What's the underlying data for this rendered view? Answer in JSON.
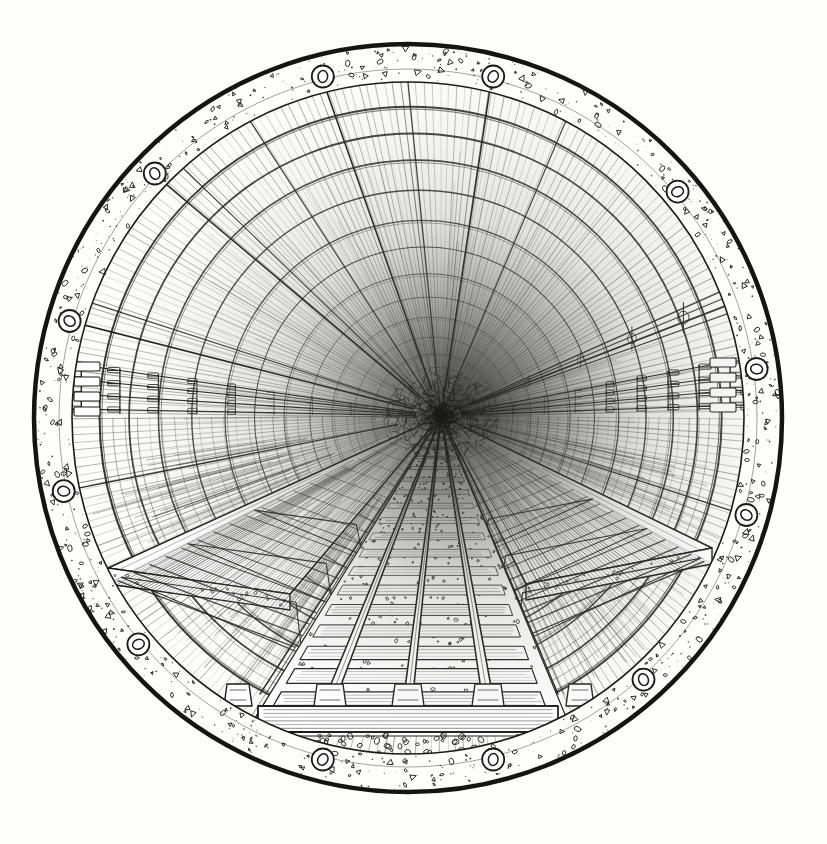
{
  "artwork": {
    "title": "Railway Tunnel Interior",
    "medium": "pen-and-ink line drawing",
    "subject": "single-track railway tunnel seen head-on in a circular vignette",
    "canvas": {
      "width": 827,
      "height": 844,
      "background": "#fdfdfc"
    },
    "ink_color": "#1a1a18",
    "paper_color": "#fdfdfc"
  },
  "circle_frame": {
    "name": "circular-vignette",
    "center_x": 408,
    "center_y": 418,
    "outer_radius": 374,
    "inner_radius": 336,
    "outer_stroke_width": 4.5,
    "inner_stroke_width": 1.6,
    "ring_label": "concrete aggregate ring",
    "aggregate_count": 320,
    "speckle_count": 520
  },
  "anchors": {
    "name": "segment-bolt-anchors",
    "label": "bolt rings set in the tunnel lining",
    "radius_from_center": 352,
    "ring_outer_r": 11,
    "ring_inner_r": 6,
    "angles_deg": [
      -104,
      -76,
      -40,
      -8,
      16,
      48,
      76,
      104,
      140,
      168,
      196,
      224
    ]
  },
  "vanishing_point": {
    "x": 441,
    "y": 416,
    "label": "tunnel vanishing point"
  },
  "lining": {
    "name": "tunnel-lining",
    "label": "segmental concrete lining with ring joints",
    "ring_joint_count": 15,
    "radial_rib_count": 5,
    "hatch_line_count": 260,
    "depth_rings": [
      0.08,
      0.16,
      0.24,
      0.33,
      0.42,
      0.5,
      0.58,
      0.65,
      0.71,
      0.77,
      0.82,
      0.86,
      0.9,
      0.93,
      0.96
    ]
  },
  "radial_guides": {
    "name": "ceiling-guide-wires",
    "label": "taut guide wires from crown bolts to vanishing point",
    "count": 4,
    "angles_deg": [
      -104,
      -76,
      196,
      224
    ]
  },
  "track": {
    "name": "railway-track",
    "gauge_label": "standard gauge",
    "rail_count": 2,
    "conductor_rail": true,
    "sleeper_count": 22,
    "sleeper_label": "timber sleepers",
    "ballast_label": "crushed stone ballast",
    "ballast_stone_count": 420,
    "near_sleeper": {
      "x": 408,
      "y": 706,
      "width": 300,
      "height": 26
    },
    "rail_left_near_x": 330,
    "rail_right_near_x": 488,
    "conductor_near_x": 408,
    "near_y": 700
  },
  "walkways": {
    "name": "maintenance-walkways",
    "count": 2,
    "left": {
      "label": "left maintenance walkway",
      "near_x": 108,
      "near_y": 568,
      "bracket_count": 3
    },
    "right": {
      "label": "right maintenance walkway",
      "near_x": 712,
      "near_y": 548,
      "bracket_count": 3
    },
    "deck_label": "walkway deck plank",
    "support_label": "cantilever bracket"
  },
  "services": {
    "left_cable_run": {
      "name": "left-cable-tray-run",
      "label": "cable trays on tunnel wall",
      "near_x": 74,
      "near_y": 386,
      "tier_count": 4,
      "bracket_count": 9
    },
    "right_cable_run": {
      "name": "right-cable-tray-run",
      "label": "cable trays on tunnel wall",
      "near_x": 736,
      "near_y": 382,
      "tier_count": 4,
      "bracket_count": 9
    },
    "overhead_conduit": {
      "name": "overhead-conduit-run",
      "label": "suspended conduit with hanger clamps",
      "hanger_count": 5,
      "near_x": 744,
      "near_y": 290
    }
  },
  "floor": {
    "name": "tunnel-invert",
    "label": "hatched concrete invert below walkways",
    "hatch_density": "cross-hatch"
  }
}
